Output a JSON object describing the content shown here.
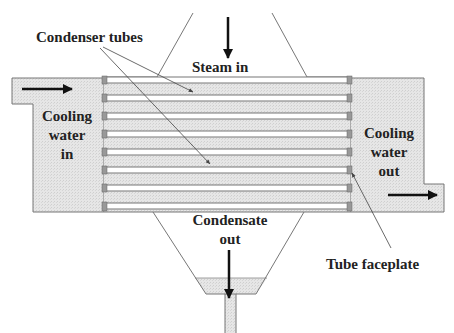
{
  "diagram": {
    "labels": {
      "condenser_tubes": "Condenser tubes",
      "steam_in": "Steam in",
      "cooling_water_in": [
        "Cooling",
        "water",
        "in"
      ],
      "cooling_water_out": [
        "Cooling",
        "water",
        "out"
      ],
      "condensate_out": [
        "Condensate",
        "out"
      ],
      "tube_faceplate": "Tube faceplate"
    },
    "tube_count": 8,
    "colors": {
      "water_fill": "#e3e3e3",
      "outline": "#777777",
      "faceplate": "#999999",
      "text": "#222222",
      "arrow": "#111111"
    }
  }
}
